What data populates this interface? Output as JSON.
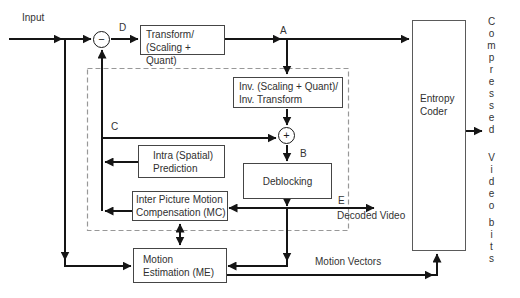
{
  "diagram": {
    "input_label": "Input",
    "node_labels": {
      "subtract": "−",
      "add": "+"
    },
    "signal_labels": {
      "a": "A",
      "b": "B",
      "c": "C",
      "d": "D",
      "e": "E"
    },
    "blocks": {
      "transform": {
        "line1": "Transform/",
        "line2": "(Scaling + Quant)"
      },
      "inverse_transform": {
        "line1": "Inv. (Scaling + Quant)/",
        "line2": "Inv. Transform"
      },
      "intra_prediction": {
        "line1": "Intra (Spatial)",
        "line2": "Prediction"
      },
      "deblocking": {
        "line1": "Deblocking"
      },
      "motion_compensation": {
        "line1": "Inter Picture Motion",
        "line2": "Compensation (MC)"
      },
      "motion_estimation": {
        "line1": "Motion",
        "line2": "Estimation (ME)"
      },
      "entropy_coder": {
        "line1": "Entropy",
        "line2": "Coder"
      }
    },
    "annotations": {
      "decoded_video": "Decoded Video",
      "motion_vectors": "Motion Vectors"
    },
    "output_stream": {
      "word1": "Compressed",
      "word2": "Video",
      "word3": "bits"
    },
    "colors": {
      "wire": "#151515",
      "box_border": "#454545",
      "dashed_border": "#989898",
      "text": "#333333",
      "background": "#ffffff"
    }
  }
}
